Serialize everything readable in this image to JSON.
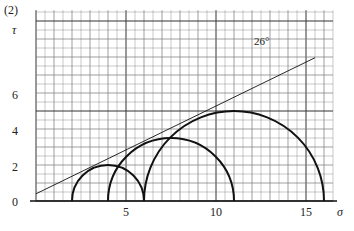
{
  "figure_label": "(2)",
  "chart_data": {
    "type": "line",
    "xlabel": "σ",
    "ylabel": "τ",
    "xlim": [
      0,
      16
    ],
    "ylim": [
      0,
      10
    ],
    "x_ticks": [
      "0",
      "5",
      "10",
      "15"
    ],
    "y_ticks": [
      "0",
      "2",
      "4",
      "6"
    ],
    "grid": true,
    "annotations": [
      "26°"
    ],
    "circles": [
      {
        "sigma3": 2,
        "sigma1": 6,
        "center": 4,
        "radius": 2
      },
      {
        "sigma3": 4,
        "sigma1": 11,
        "center": 7.5,
        "radius": 3.5
      },
      {
        "sigma3": 6,
        "sigma1": 16,
        "center": 11,
        "radius": 5
      }
    ],
    "envelope": {
      "angle_deg": 26,
      "intercept": 0.4,
      "x": [
        0,
        15.5
      ],
      "y": [
        0.4,
        7.96
      ]
    }
  },
  "axis": {
    "x_label": "σ",
    "y_label": "τ",
    "zero": "0",
    "x5": "5",
    "x10": "10",
    "x15": "15",
    "y2": "2",
    "y4": "4",
    "y6": "6",
    "angle": "26°"
  }
}
